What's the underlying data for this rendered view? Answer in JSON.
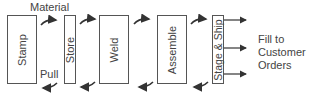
{
  "diagram": {
    "type": "pull-system-flow",
    "stations": [
      {
        "id": "stamp",
        "label": "Stamp"
      },
      {
        "id": "store",
        "label": "Store"
      },
      {
        "id": "weld",
        "label": "Weld"
      },
      {
        "id": "assemble",
        "label": "Assemble"
      },
      {
        "id": "stage-ship",
        "label": "Stage & Ship"
      }
    ],
    "labels": {
      "material": "Material",
      "pull": "Pull"
    },
    "output": {
      "line1": "Fill to",
      "line2": "Customer",
      "line3": "Orders"
    },
    "colors": {
      "stroke": "#555555",
      "text": "#444444",
      "arrow": "#333333"
    }
  }
}
